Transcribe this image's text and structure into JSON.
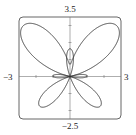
{
  "chart_data": {
    "type": "line",
    "subtype": "polar-curve",
    "title": "",
    "xlabel": "",
    "ylabel": "",
    "equation": "r = e^(sin θ) − 2cos(4θ)",
    "xlim": [
      -3,
      3
    ],
    "ylim": [
      -2.5,
      3.5
    ],
    "tick_labels": {
      "x_min": "−3",
      "x_max": "3",
      "y_min": "−2.5",
      "y_max": "3.5"
    },
    "x_ticks": [
      -2,
      -1,
      1,
      2
    ],
    "y_ticks": [
      -2,
      -1,
      1,
      2,
      3
    ],
    "grid": false,
    "legend": null,
    "series": [
      {
        "name": "butterfly curve",
        "theta_range": [
          0,
          6.283185
        ],
        "color": "#333333"
      }
    ]
  },
  "labels": {
    "top": "3.5",
    "bottom": "−2.5",
    "left": "−3",
    "right": "3"
  },
  "colors": {
    "curve": "#333333",
    "axis": "#555555",
    "frame": "#555555"
  }
}
